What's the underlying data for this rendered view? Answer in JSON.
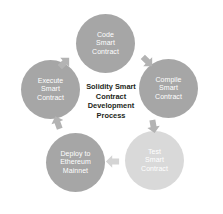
{
  "diagram": {
    "type": "cycle",
    "direction": "clockwise",
    "center": {
      "text": "Solidity Smart\nContract\nDevelopment\nProcess",
      "text_color": "#231f20"
    },
    "frame": {
      "border_color": "#3a3a3a",
      "background": "#ffffff"
    },
    "nodes": [
      {
        "id": "code",
        "label": "Code\nSmart\nContract",
        "color": "#a6a6a6",
        "text_color": "#ffffff",
        "order": 1
      },
      {
        "id": "compile",
        "label": "Compile\nSmart\nContract",
        "color": "#a6a6a6",
        "text_color": "#ffffff",
        "order": 2
      },
      {
        "id": "test",
        "label": "Test\nSmart\nContract",
        "color": "#d9d9d9",
        "text_color": "#ffffff",
        "order": 3
      },
      {
        "id": "deploy",
        "label": "Deploy to\nEthereum\nMainnet",
        "color": "#a6a6a6",
        "text_color": "#ffffff",
        "order": 4
      },
      {
        "id": "execute",
        "label": "Execute\nSmart\nContract",
        "color": "#a6a6a6",
        "text_color": "#ffffff",
        "order": 5
      }
    ],
    "arrows": [
      {
        "id": "execute-code",
        "from": "execute",
        "to": "code",
        "color": "#b3b3b3"
      },
      {
        "id": "code-compile",
        "from": "code",
        "to": "compile",
        "color": "#b3b3b3"
      },
      {
        "id": "compile-test",
        "from": "compile",
        "to": "test",
        "color": "#b3b3b3"
      },
      {
        "id": "test-deploy",
        "from": "test",
        "to": "deploy",
        "color": "#d4d4d4"
      },
      {
        "id": "deploy-execute",
        "from": "deploy",
        "to": "execute",
        "color": "#b3b3b3"
      }
    ]
  }
}
